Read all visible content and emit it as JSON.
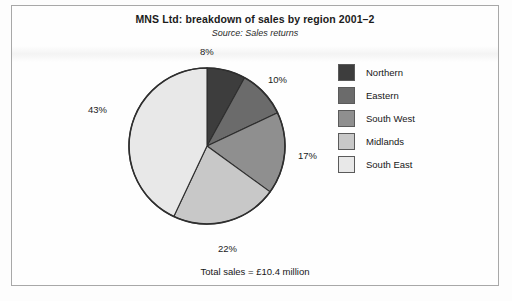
{
  "figure": {
    "title": "MNS Ltd: breakdown of sales by region 2001–2",
    "subtitle": "Source: Sales returns",
    "total_caption": "Total sales = £10.4 million"
  },
  "legend": {
    "items": [
      {
        "label": "Northern",
        "color": "#3d3d3d"
      },
      {
        "label": "Eastern",
        "color": "#6b6b6b"
      },
      {
        "label": "South West",
        "color": "#8f8f8f"
      },
      {
        "label": "Midlands",
        "color": "#c8c8c8"
      },
      {
        "label": "South East",
        "color": "#e8e8e8"
      }
    ]
  },
  "labels": {
    "northern_pct": "8%",
    "eastern_pct": "10%",
    "south_west_pct": "17%",
    "midlands_pct": "22%",
    "south_east_pct": "43%"
  },
  "chart_data": {
    "type": "pie",
    "title": "MNS Ltd: breakdown of sales by region 2001–2",
    "subtitle": "Source: Sales returns",
    "categories": [
      "Northern",
      "Eastern",
      "South West",
      "Midlands",
      "South East"
    ],
    "values": [
      8,
      10,
      17,
      22,
      43
    ],
    "value_labels": [
      "8%",
      "10%",
      "17%",
      "22%",
      "43%"
    ],
    "units": "percent",
    "total": 100,
    "total_sales": "£10.4 million",
    "colors": [
      "#3d3d3d",
      "#6b6b6b",
      "#8f8f8f",
      "#c8c8c8",
      "#e8e8e8"
    ],
    "start_angle_deg": 0,
    "direction": "clockwise",
    "legend_position": "right",
    "grid": false,
    "xlabel": "",
    "ylabel": ""
  }
}
